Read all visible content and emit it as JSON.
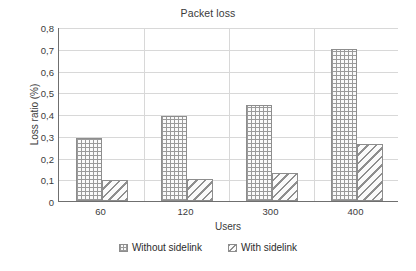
{
  "chart_data": {
    "type": "bar",
    "title": "Packet loss",
    "xlabel": "Users",
    "ylabel": "Loss ratio (%)",
    "categories": [
      "60",
      "120",
      "300",
      "400"
    ],
    "series": [
      {
        "name": "Without sidelink",
        "pattern": "crosshatch",
        "values": [
          0.29,
          0.39,
          0.44,
          0.7
        ]
      },
      {
        "name": "With sidelink",
        "pattern": "diagonal-hatch",
        "values": [
          0.095,
          0.1,
          0.13,
          0.26
        ]
      }
    ],
    "ylim": [
      0,
      0.8
    ],
    "yticks": [
      "0",
      "0,1",
      "0,2",
      "0,3",
      "0,4",
      "0,5",
      "0,6",
      "0,7",
      "0,8"
    ],
    "ytick_values": [
      0,
      0.1,
      0.2,
      0.3,
      0.4,
      0.5,
      0.6,
      0.7,
      0.8
    ],
    "grid": true,
    "legend_position": "bottom",
    "colors": {
      "background": "#ffffff",
      "axis": "#6f6f6f",
      "grid": "#d8d8d8",
      "hatch": "#9a9a9a",
      "text": "#2b2b2b"
    }
  }
}
